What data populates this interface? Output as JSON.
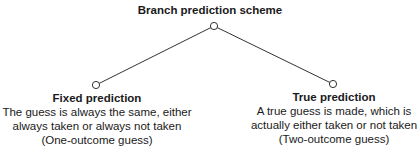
{
  "diagram": {
    "root": {
      "label": "Branch prediction scheme"
    },
    "children": [
      {
        "title": "Fixed prediction",
        "lines": [
          "The guess is always the same, either",
          "always taken or always not taken",
          "(One-outcome guess)"
        ]
      },
      {
        "title": "True prediction",
        "lines": [
          "A true guess is made, which is",
          "actually either taken or not taken",
          "(Two-outcome guess)"
        ]
      }
    ],
    "colors": {
      "line": "#333333",
      "node_fill": "#ffffff",
      "text": "#1a1a1a"
    }
  }
}
